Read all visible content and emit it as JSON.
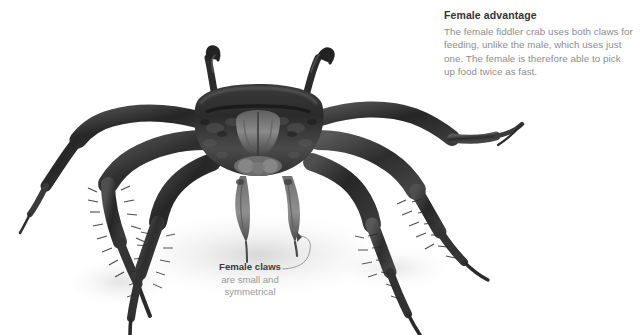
{
  "figure": {
    "subject": "female fiddler crab",
    "background_color": "#ffffff",
    "image_style": "grayscale photograph, front view"
  },
  "callout": {
    "title": "Female advantage",
    "body": "The female fiddler crab uses both claws for feeding, unlike the male, which uses just one. The female is therefore able to pick up food twice as fast.",
    "title_color": "#333333",
    "body_color": "#8c8c8c"
  },
  "leader_caption": {
    "title": "Female claws",
    "line2": "are small and",
    "line3": "symmetrical",
    "title_color": "#3a3a3a",
    "sub_color": "#9a9a9a",
    "leader_color": "#9b9b9b"
  },
  "icons": {
    "leader_line": "curved-leader-line-icon",
    "arrow_head": "arrowhead-icon"
  }
}
